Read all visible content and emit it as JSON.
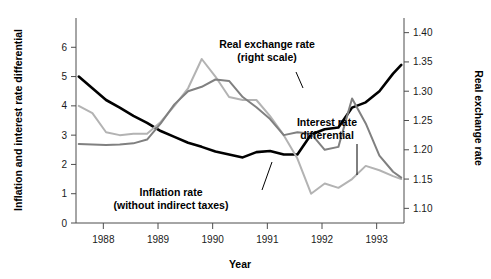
{
  "chart_data": {
    "type": "line",
    "title": "",
    "xlabel": "Year",
    "ylabel": "Inflation and interest rate differential",
    "y2label": "Real exchange rate",
    "grid": false,
    "legend": "inline-annotations",
    "xlim": [
      1987.5,
      1993.5
    ],
    "ylim": [
      0,
      7
    ],
    "y2lim": [
      1.075,
      1.425
    ],
    "xticks": [
      "1988",
      "1989",
      "1990",
      "1991",
      "1992",
      "1993"
    ],
    "xtick_values": [
      1988,
      1989,
      1990,
      1991,
      1992,
      1993
    ],
    "yticks": [
      "0",
      "1",
      "2",
      "3",
      "4",
      "5",
      "6"
    ],
    "ytick_values": [
      0,
      1,
      2,
      3,
      4,
      5,
      6
    ],
    "y2ticks": [
      "1.10",
      "1.15",
      "1.20",
      "1.25",
      "1.30",
      "1.35",
      "1.40"
    ],
    "y2tick_values": [
      1.1,
      1.15,
      1.2,
      1.25,
      1.3,
      1.35,
      1.4
    ],
    "series": [
      {
        "name": "Real exchange rate",
        "axis": "right",
        "color": "#000000",
        "width": 2.6,
        "x": [
          1987.55,
          1987.8,
          1988.05,
          1988.3,
          1988.55,
          1988.8,
          1989.05,
          1989.3,
          1989.55,
          1989.8,
          1990.05,
          1990.3,
          1990.55,
          1990.8,
          1991.05,
          1991.3,
          1991.55,
          1991.8,
          1992.05,
          1992.3,
          1992.55,
          1992.8,
          1993.05,
          1993.3,
          1993.45
        ],
        "values": [
          1.325,
          1.305,
          1.285,
          1.272,
          1.258,
          1.246,
          1.232,
          1.222,
          1.212,
          1.205,
          1.197,
          1.192,
          1.187,
          1.196,
          1.198,
          1.192,
          1.192,
          1.226,
          1.235,
          1.238,
          1.272,
          1.281,
          1.3,
          1.33,
          1.345
        ]
      },
      {
        "name": "Inflation rate (without indirect taxes)",
        "axis": "left",
        "color": "#b3b3b3",
        "width": 2.0,
        "x": [
          1987.55,
          1987.8,
          1988.05,
          1988.3,
          1988.55,
          1988.8,
          1989.05,
          1989.3,
          1989.55,
          1989.8,
          1990.05,
          1990.3,
          1990.55,
          1990.8,
          1991.05,
          1991.3,
          1991.55,
          1991.8,
          1992.05,
          1992.3,
          1992.55,
          1992.8,
          1993.05,
          1993.3,
          1993.45
        ],
        "values": [
          4.0,
          3.75,
          3.1,
          3.0,
          3.05,
          3.05,
          3.45,
          4.0,
          4.6,
          5.6,
          5.0,
          4.3,
          4.2,
          4.2,
          3.65,
          3.0,
          2.2,
          1.0,
          1.35,
          1.2,
          1.5,
          1.95,
          1.8,
          1.6,
          1.5
        ]
      },
      {
        "name": "Interest rate differential",
        "axis": "left",
        "color": "#808080",
        "width": 2.0,
        "x": [
          1987.55,
          1987.8,
          1988.05,
          1988.3,
          1988.55,
          1988.8,
          1989.05,
          1989.3,
          1989.55,
          1989.8,
          1990.05,
          1990.3,
          1990.55,
          1990.8,
          1991.05,
          1991.3,
          1991.55,
          1991.8,
          1992.05,
          1992.3,
          1992.55,
          1992.8,
          1993.05,
          1993.3,
          1993.45
        ],
        "values": [
          2.7,
          2.68,
          2.66,
          2.68,
          2.72,
          2.85,
          3.4,
          4.05,
          4.5,
          4.65,
          4.9,
          4.85,
          4.3,
          3.95,
          3.55,
          3.0,
          3.1,
          3.05,
          2.5,
          2.6,
          4.25,
          3.4,
          2.3,
          1.75,
          1.55
        ]
      }
    ],
    "annotations": [
      {
        "id": "real-exchange-rate",
        "lines": [
          "Real exchange rate",
          "(right scale)"
        ],
        "x": 267,
        "y": 48
      },
      {
        "id": "interest-rate-differential",
        "lines": [
          "Interest rate",
          "differential"
        ],
        "x": 327,
        "y": 126
      },
      {
        "id": "inflation-rate",
        "lines": [
          "Inflation rate",
          "(without indirect taxes)"
        ],
        "x": 171,
        "y": 196
      }
    ]
  }
}
